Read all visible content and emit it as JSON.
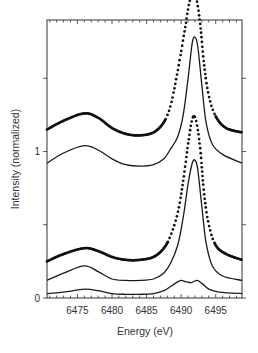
{
  "chart_data": {
    "type": "line",
    "title": "",
    "xlabel": "Energy (eV)",
    "ylabel": "Intensity (normalized)",
    "xlim": [
      6470.6,
      6498.8
    ],
    "ylim": [
      0,
      1.9
    ],
    "x_ticks": [
      6475,
      6480,
      6485,
      6490,
      6495
    ],
    "x_tick_labels": [
      "6475",
      "6480",
      "6485",
      "6490",
      "6495"
    ],
    "y_ticks": [
      0,
      0.5,
      1,
      1.5
    ],
    "y_tick_labels": [
      "0",
      "",
      "1",
      ""
    ],
    "grid": false,
    "legend": null,
    "series": [
      {
        "name": "upper-dotted (experimental)",
        "style": "dots",
        "points": [
          [
            6470.6,
            1.15
          ],
          [
            6473,
            1.21
          ],
          [
            6476,
            1.26
          ],
          [
            6478,
            1.23
          ],
          [
            6480,
            1.16
          ],
          [
            6482,
            1.12
          ],
          [
            6484,
            1.11
          ],
          [
            6486,
            1.13
          ],
          [
            6487.5,
            1.2
          ],
          [
            6488.5,
            1.32
          ],
          [
            6489.5,
            1.55
          ],
          [
            6490.5,
            1.82
          ],
          [
            6491.2,
            2.02
          ],
          [
            6491.8,
            2.06
          ],
          [
            6492.3,
            2.02
          ],
          [
            6492.8,
            1.85
          ],
          [
            6493.3,
            1.6
          ],
          [
            6494,
            1.38
          ],
          [
            6495,
            1.24
          ],
          [
            6496.5,
            1.16
          ],
          [
            6498.8,
            1.13
          ]
        ]
      },
      {
        "name": "upper-solid (calculated)",
        "style": "line",
        "points": [
          [
            6470.6,
            0.92
          ],
          [
            6473,
            0.99
          ],
          [
            6476,
            1.04
          ],
          [
            6478,
            1.01
          ],
          [
            6480,
            0.95
          ],
          [
            6482,
            0.91
          ],
          [
            6484,
            0.9
          ],
          [
            6486,
            0.91
          ],
          [
            6487.5,
            0.95
          ],
          [
            6488.5,
            1.02
          ],
          [
            6489.5,
            1.1
          ],
          [
            6490.3,
            1.25
          ],
          [
            6491,
            1.5
          ],
          [
            6491.6,
            1.74
          ],
          [
            6492,
            1.78
          ],
          [
            6492.4,
            1.72
          ],
          [
            6493,
            1.45
          ],
          [
            6493.6,
            1.2
          ],
          [
            6494.5,
            1.05
          ],
          [
            6496,
            0.98
          ],
          [
            6498.8,
            0.92
          ]
        ]
      },
      {
        "name": "lower-dotted (experimental)",
        "style": "dots",
        "points": [
          [
            6470.6,
            0.25
          ],
          [
            6473,
            0.3
          ],
          [
            6476,
            0.34
          ],
          [
            6478,
            0.32
          ],
          [
            6480,
            0.28
          ],
          [
            6482,
            0.26
          ],
          [
            6484,
            0.26
          ],
          [
            6486,
            0.28
          ],
          [
            6487.5,
            0.34
          ],
          [
            6488.5,
            0.43
          ],
          [
            6489.5,
            0.58
          ],
          [
            6490.3,
            0.8
          ],
          [
            6491,
            1.05
          ],
          [
            6491.5,
            1.2
          ],
          [
            6491.9,
            1.24
          ],
          [
            6492.3,
            1.18
          ],
          [
            6492.8,
            1.0
          ],
          [
            6493.3,
            0.72
          ],
          [
            6494,
            0.5
          ],
          [
            6495,
            0.36
          ],
          [
            6496.5,
            0.3
          ],
          [
            6498.8,
            0.26
          ]
        ]
      },
      {
        "name": "middle-solid (calculated)",
        "style": "line",
        "points": [
          [
            6470.6,
            0.12
          ],
          [
            6473,
            0.17
          ],
          [
            6476,
            0.22
          ],
          [
            6478,
            0.18
          ],
          [
            6480,
            0.13
          ],
          [
            6482,
            0.12
          ],
          [
            6484,
            0.12
          ],
          [
            6486,
            0.13
          ],
          [
            6487.5,
            0.17
          ],
          [
            6488.5,
            0.24
          ],
          [
            6489.5,
            0.36
          ],
          [
            6490.3,
            0.55
          ],
          [
            6491,
            0.78
          ],
          [
            6491.6,
            0.92
          ],
          [
            6492,
            0.94
          ],
          [
            6492.4,
            0.88
          ],
          [
            6493,
            0.62
          ],
          [
            6493.6,
            0.38
          ],
          [
            6494.5,
            0.22
          ],
          [
            6496,
            0.15
          ],
          [
            6498.8,
            0.12
          ]
        ]
      },
      {
        "name": "bottom-solid (calculated)",
        "style": "line",
        "points": [
          [
            6470.6,
            0.03
          ],
          [
            6473,
            0.04
          ],
          [
            6476,
            0.06
          ],
          [
            6478,
            0.05
          ],
          [
            6480,
            0.03
          ],
          [
            6482,
            0.025
          ],
          [
            6484,
            0.025
          ],
          [
            6486,
            0.03
          ],
          [
            6487.5,
            0.05
          ],
          [
            6488.5,
            0.08
          ],
          [
            6489.5,
            0.11
          ],
          [
            6490,
            0.12
          ],
          [
            6490.8,
            0.11
          ],
          [
            6491.5,
            0.105
          ],
          [
            6492.3,
            0.12
          ],
          [
            6493,
            0.1
          ],
          [
            6494,
            0.06
          ],
          [
            6495.5,
            0.04
          ],
          [
            6498.8,
            0.03
          ]
        ]
      }
    ]
  }
}
